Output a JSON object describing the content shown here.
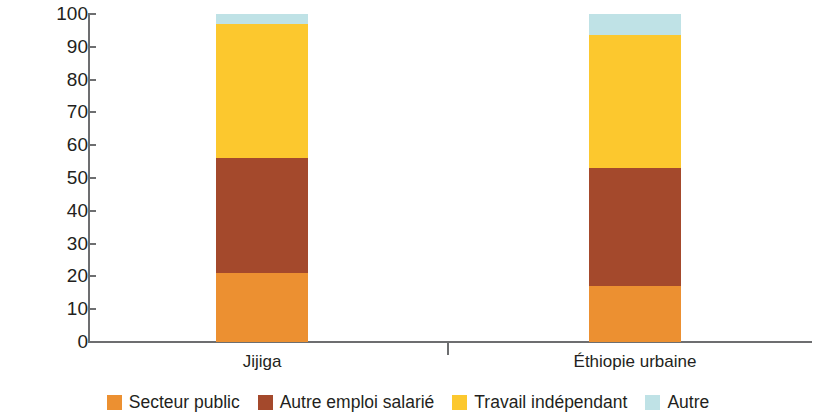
{
  "chart_data": {
    "type": "bar",
    "subtype": "stacked-bar-100",
    "title": "",
    "xlabel": "",
    "ylabel": "Pourcentage",
    "ylim": [
      0,
      100
    ],
    "ytick_step": 10,
    "ytick_labels": [
      "100",
      "90",
      "80",
      "70",
      "60",
      "50",
      "40",
      "30",
      "20",
      "10",
      "0"
    ],
    "grid": false,
    "legend_position": "bottom",
    "categories": [
      "Jijiga",
      "Éthiopie urbaine"
    ],
    "series": [
      {
        "name": "Secteur public",
        "color": "#ec9031",
        "values": [
          21,
          17
        ]
      },
      {
        "name": "Autre emploi salarié",
        "color": "#a4492c",
        "values": [
          35,
          36
        ]
      },
      {
        "name": "Travail indépendant",
        "color": "#fcc82e",
        "values": [
          41,
          40.5
        ]
      },
      {
        "name": "Autre",
        "color": "#bfe2e6",
        "values": [
          3,
          6.5
        ]
      }
    ]
  },
  "axis": {
    "y_title": "Pourcentage",
    "y_ticks": [
      {
        "label": "100",
        "value": 100
      },
      {
        "label": "90",
        "value": 90
      },
      {
        "label": "80",
        "value": 80
      },
      {
        "label": "70",
        "value": 70
      },
      {
        "label": "60",
        "value": 60
      },
      {
        "label": "50",
        "value": 50
      },
      {
        "label": "40",
        "value": 40
      },
      {
        "label": "30",
        "value": 30
      },
      {
        "label": "20",
        "value": 20
      },
      {
        "label": "10",
        "value": 10
      },
      {
        "label": "0",
        "value": 0
      }
    ],
    "x_labels": [
      "Jijiga",
      "Éthiopie urbaine"
    ]
  },
  "legend": {
    "items": [
      {
        "label": "Secteur public",
        "color": "#ec9031"
      },
      {
        "label": "Autre emploi salarié",
        "color": "#a4492c"
      },
      {
        "label": "Travail indépendant",
        "color": "#fcc82e"
      },
      {
        "label": "Autre",
        "color": "#bfe2e6"
      }
    ]
  },
  "colors": {
    "axis": "#6d6e70",
    "text": "#231f20",
    "background": "#ffffff"
  }
}
